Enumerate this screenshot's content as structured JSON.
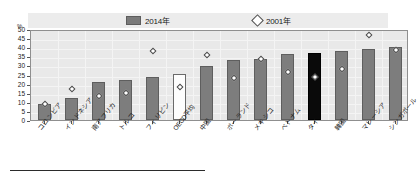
{
  "chart_data": {
    "type": "bar",
    "title": "",
    "xlabel": "",
    "ylabel": "%",
    "ylim": [
      0,
      50
    ],
    "ytick_step": 5,
    "yticks": [
      0,
      5,
      10,
      15,
      20,
      25,
      30,
      35,
      40,
      45,
      50
    ],
    "grid": true,
    "legend_position": "top",
    "categories": [
      "コロンビア",
      "インドネシア",
      "南アフリカ",
      "トルコ",
      "フィリピン",
      "OECD平均",
      "中国",
      "ポーランド",
      "メキシコ",
      "ベトナム",
      "タイ",
      "韓国",
      "マレーシア",
      "シンガポール"
    ],
    "series": [
      {
        "name": "2014年",
        "type": "bar",
        "values": [
          9.0,
          12.0,
          20.8,
          22.0,
          23.5,
          25.2,
          29.5,
          33.0,
          33.5,
          36.0,
          37.0,
          38.0,
          39.0,
          40.0
        ]
      },
      {
        "name": "2001年",
        "type": "scatter",
        "values": [
          8.7,
          17.0,
          13.0,
          15.0,
          38.0,
          18.0,
          35.5,
          23.0,
          33.5,
          26.5,
          23.8,
          28.3,
          46.8,
          38.7
        ]
      }
    ],
    "bar_colors": [
      "#7d7d7d",
      "#7d7d7d",
      "#7d7d7d",
      "#7d7d7d",
      "#7d7d7d",
      "#fdfdfd",
      "#7d7d7d",
      "#7d7d7d",
      "#7d7d7d",
      "#7d7d7d",
      "#0a0a0a",
      "#7d7d7d",
      "#7d7d7d",
      "#7d7d7d"
    ]
  },
  "legend": {
    "entries": [
      {
        "label": "2014年",
        "marker": "bar-swatch"
      },
      {
        "label": "2001年",
        "marker": "diamond-swatch"
      }
    ]
  },
  "axis": {
    "unit_label": "%",
    "y_tick_labels": [
      "50",
      "45",
      "40",
      "35",
      "30",
      "25",
      "20",
      "15",
      "10",
      "5",
      "0"
    ]
  },
  "colors": {
    "bar_gray": "#7d7d7d",
    "bar_white": "#fdfdfd",
    "bar_black": "#0a0a0a",
    "plot_background": "#e9e9e9",
    "legend_background": "#ececec"
  }
}
